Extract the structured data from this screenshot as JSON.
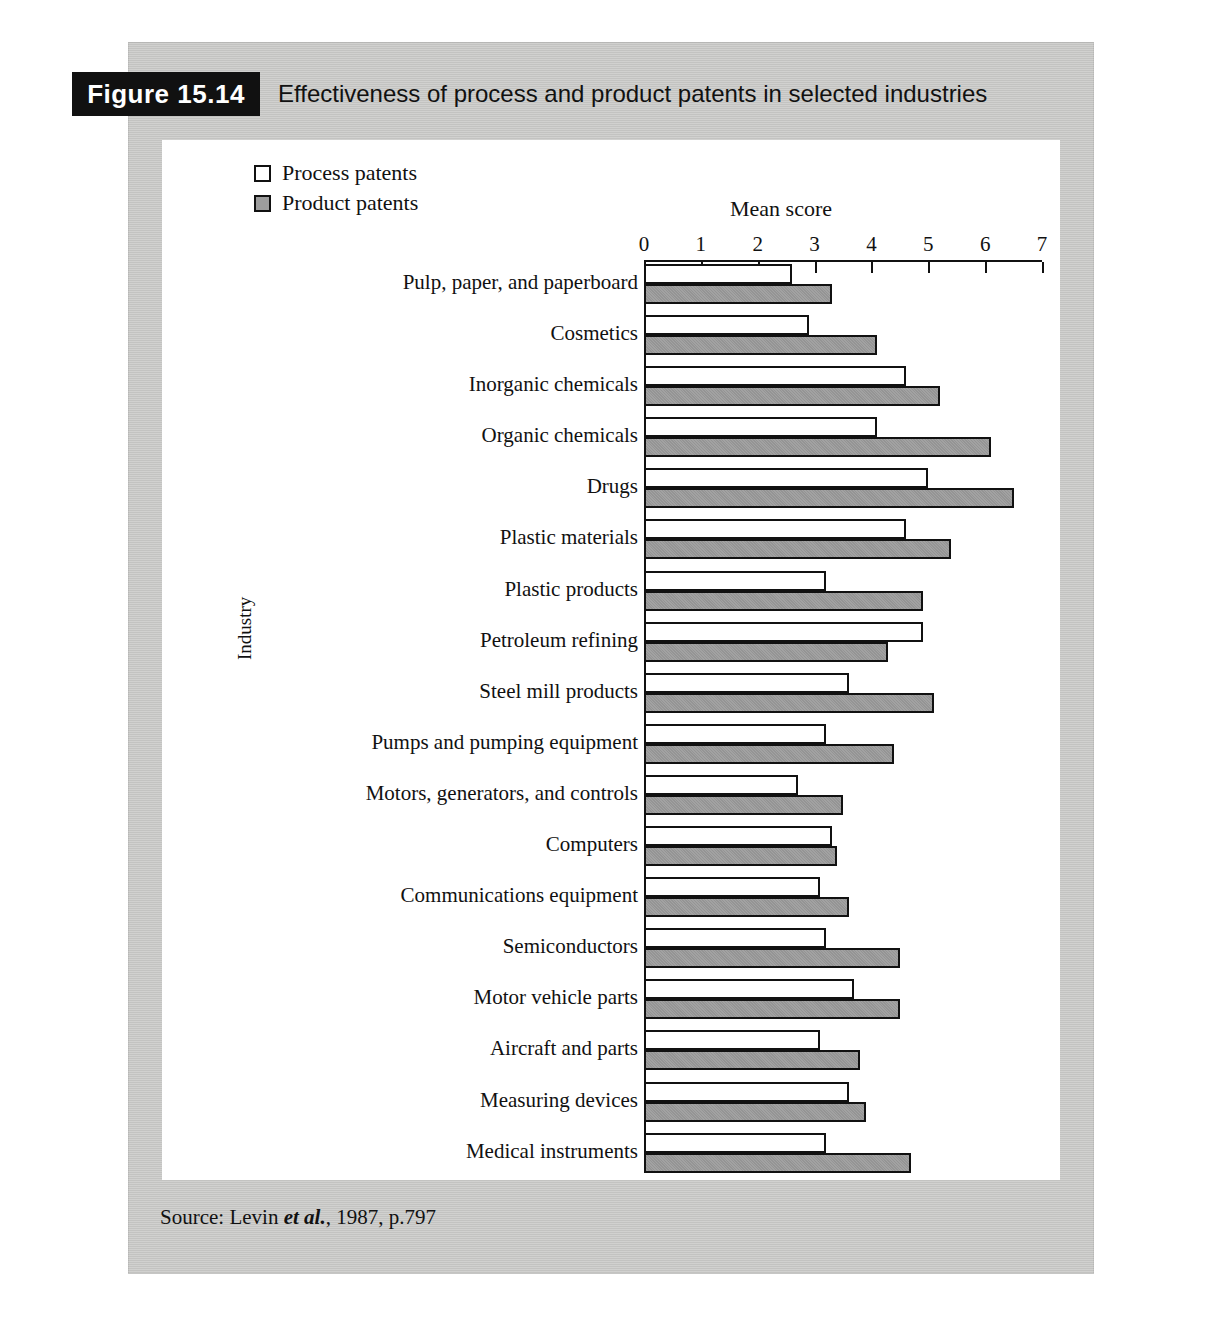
{
  "figure": {
    "tag": "Figure 15.14",
    "title": "Effectiveness of process and product patents in selected industries",
    "source": "Source: Levin et al., 1987, p.797",
    "source_prefix": "Source: Levin ",
    "source_emphasis": "et al.",
    "source_suffix": ", 1987, p.797"
  },
  "legend": {
    "items": [
      {
        "label": "Process patents",
        "swatch": "white-square",
        "color": "#ffffff"
      },
      {
        "label": "Product patents",
        "swatch": "grey-square",
        "color": "#9d9d9d"
      }
    ]
  },
  "chart_data": {
    "type": "bar",
    "orientation": "horizontal",
    "title": "Effectiveness of process and product patents in selected industries",
    "xlabel": "Mean score",
    "ylabel": "Industry",
    "xlim": [
      0,
      7
    ],
    "xticks": [
      0,
      1,
      2,
      3,
      4,
      5,
      6,
      7
    ],
    "xticklabels": [
      "0",
      "1",
      "2",
      "3",
      "4",
      "5",
      "6",
      "7"
    ],
    "grid": false,
    "legend_position": "top-left",
    "categories": [
      "Pulp, paper, and paperboard",
      "Cosmetics",
      "Inorganic chemicals",
      "Organic chemicals",
      "Drugs",
      "Plastic materials",
      "Plastic products",
      "Petroleum refining",
      "Steel mill products",
      "Pumps and pumping equipment",
      "Motors, generators, and controls",
      "Computers",
      "Communications equipment",
      "Semiconductors",
      "Motor vehicle parts",
      "Aircraft and parts",
      "Measuring devices",
      "Medical instruments"
    ],
    "series": [
      {
        "name": "Process patents",
        "color": "#ffffff",
        "values": [
          2.6,
          2.9,
          4.6,
          4.1,
          5.0,
          4.6,
          3.2,
          4.9,
          3.6,
          3.2,
          2.7,
          3.3,
          3.1,
          3.2,
          3.7,
          3.1,
          3.6,
          3.2
        ]
      },
      {
        "name": "Product patents",
        "color": "#9d9d9d",
        "values": [
          3.3,
          4.1,
          5.2,
          6.1,
          6.5,
          5.4,
          4.9,
          4.3,
          5.1,
          4.4,
          3.5,
          3.4,
          3.6,
          4.5,
          4.5,
          3.8,
          3.9,
          4.7
        ]
      }
    ]
  },
  "colors": {
    "plate": "#c9c9c7",
    "panel": "#ffffff",
    "ink": "#111111",
    "product_fill": "#9d9d9d"
  }
}
